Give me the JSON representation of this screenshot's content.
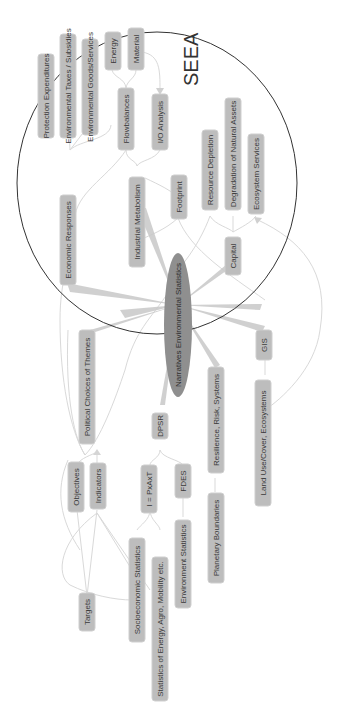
{
  "diagram": {
    "type": "mind-map",
    "orientation": "rotated-90-ccw",
    "colors": {
      "background": "#ffffff",
      "node_fill": "#bdbdbd",
      "center_fill": "#8f8f8f",
      "edge": "#d9d9d9",
      "text": "#3a3a3a",
      "circle_stroke": "#333333"
    },
    "group": {
      "label": "SEEA"
    },
    "center": {
      "label": "Narratives Environmental Statistics"
    },
    "nodes": {
      "protection_expenditures": "Protection Expenditures",
      "environmental_taxes": "Environmental Taxes / Subsidies",
      "environmental_goods": "Environmental Goods/Services",
      "energy": "Energy",
      "material": "Material",
      "flowbalances": "Flowbalances",
      "io_analysis": "I/O Analysis",
      "economic_responses": "Economic Responses",
      "industrial_metabolism": "Industrial Metabolism",
      "footprint": "Footprint",
      "resource_depletion": "Resource Depletion",
      "degradation": "Degradation of Natural Assets",
      "ecosystem_services": "Ecosystem Services",
      "capital": "Capital",
      "political_choices": "Political Choices of Themes",
      "gis": "GIS",
      "resilience": "Resilience, Risk, Systems",
      "land_use": "Land Use/Cover, Ecosystems",
      "dpsr": "DPSR",
      "objectives": "Objectives",
      "indicators": "Indicators",
      "ipat": "I = PxAxT",
      "fdes": "FDES",
      "planetary_boundaries": "Planetary Boundaries",
      "targets": "Targets",
      "socioeconomic": "Socioeconomic Statistics",
      "statistics_energy": "Statistics of Energy, Agro, Mobility etc.",
      "environment_statistics": "Environment Statistics"
    }
  }
}
